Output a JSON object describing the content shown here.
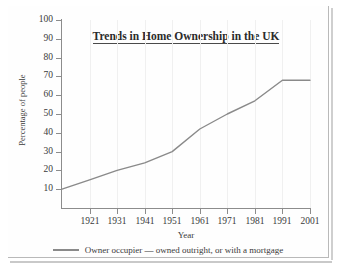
{
  "chart_data": {
    "type": "line",
    "title": "Trends in Home Ownership in the UK",
    "xlabel": "Year",
    "ylabel": "Percentage of people",
    "grid": "faint vertical gridlines only",
    "legend_position": "below-center",
    "xlim": [
      1911,
      2001
    ],
    "ylim": [
      0,
      100
    ],
    "yticks": [
      10,
      20,
      30,
      40,
      50,
      60,
      70,
      80,
      90,
      100
    ],
    "xticks": [
      1921,
      1931,
      1941,
      1951,
      1961,
      1971,
      1981,
      1991,
      2001
    ],
    "x": [
      1911,
      1921,
      1931,
      1941,
      1951,
      1961,
      1971,
      1981,
      1991,
      2001
    ],
    "series": [
      {
        "name": "Owner occupier — owned outright, or with a mortgage",
        "values": [
          10,
          15,
          20,
          24,
          30,
          42,
          50,
          57,
          68,
          68
        ],
        "color": "#8a8a8a"
      }
    ]
  },
  "axes": {
    "ytick_labels": [
      "100",
      "90",
      "80",
      "70",
      "60",
      "50",
      "40",
      "30",
      "20",
      "10"
    ],
    "xtick_labels": [
      "1921",
      "1931",
      "1941",
      "1951",
      "1961",
      "1971",
      "1981",
      "1991",
      "2001"
    ]
  },
  "legend": {
    "label": "Owner occupier — owned outright, or with a mortgage"
  },
  "colors": {
    "line": "#8a8a8a",
    "axis": "#8c8c8c",
    "text": "#3a3a3a",
    "title": "#2b2b2b",
    "grid": "#f0f0f0",
    "frame": "#b9b9b9",
    "background": "#ffffff"
  }
}
